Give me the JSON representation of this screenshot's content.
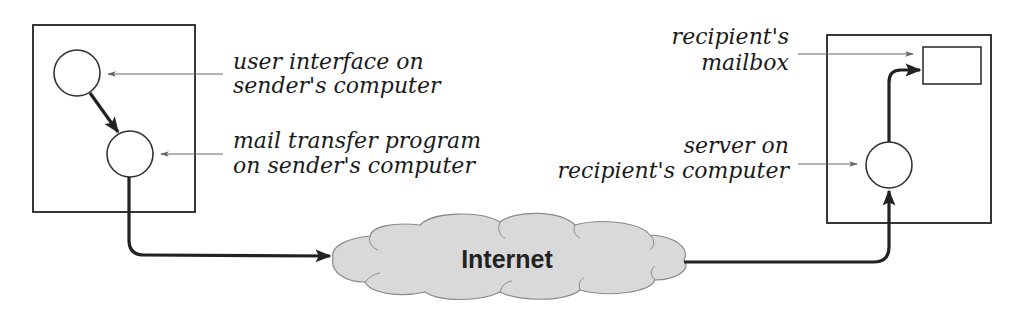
{
  "diagram": {
    "colors": {
      "stroke": "#222222",
      "thin_stroke": "#555555",
      "cloud_fill": "#d9d9d9",
      "background": "#ffffff"
    },
    "sender": {
      "box": {
        "x": 33,
        "y": 25,
        "w": 162,
        "h": 187
      },
      "ui_node": {
        "cx": 77,
        "cy": 73,
        "r": 23
      },
      "mta_node": {
        "cx": 130,
        "cy": 154,
        "r": 23
      },
      "labels": {
        "ui": [
          "user interface on",
          "sender's computer"
        ],
        "mta": [
          "mail transfer program",
          "on sender's computer"
        ]
      }
    },
    "network": {
      "label": "Internet"
    },
    "recipient": {
      "box": {
        "x": 827,
        "y": 35,
        "w": 164,
        "h": 188
      },
      "mailbox": {
        "x": 923,
        "y": 47,
        "w": 58,
        "h": 37
      },
      "server_node": {
        "cx": 889,
        "cy": 165,
        "r": 23
      },
      "labels": {
        "mailbox": [
          "recipient's",
          "mailbox"
        ],
        "server": [
          "server on",
          "recipient's computer"
        ]
      }
    }
  }
}
